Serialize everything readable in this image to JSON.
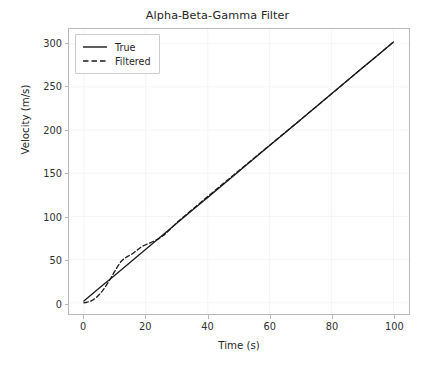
{
  "figure": {
    "width": 435,
    "height": 365,
    "background_color": "#ffffff"
  },
  "chart_data": {
    "type": "line",
    "title": "Alpha-Beta-Gamma Filter",
    "xlabel": "Time (s)",
    "ylabel": "Velocity (m/s)",
    "xlim": [
      -4.8,
      105.0
    ],
    "ylim": [
      -13.0,
      317.0
    ],
    "xticks": [
      0,
      20,
      40,
      60,
      80,
      100
    ],
    "yticks": [
      0,
      50,
      100,
      150,
      200,
      250,
      300
    ],
    "xtick_labels": [
      "0",
      "20",
      "40",
      "60",
      "80",
      "100"
    ],
    "ytick_labels": [
      "0",
      "50",
      "100",
      "150",
      "200",
      "250",
      "300"
    ],
    "grid": true,
    "grid_color": "#f4f4f4",
    "axes_edge_color": "#b8b8b8",
    "legend": {
      "position": "upper left",
      "entries": [
        {
          "label": "True",
          "linestyle": "solid",
          "color": "#1a1a1a"
        },
        {
          "label": "Filtered",
          "linestyle": "dashed",
          "color": "#1a1a1a"
        }
      ]
    },
    "series": [
      {
        "name": "True",
        "linestyle": "solid",
        "color": "#1a1a1a",
        "linewidth": 1.3,
        "x": [
          0,
          5,
          10,
          15,
          20,
          25,
          30,
          35,
          40,
          45,
          50,
          55,
          60,
          65,
          70,
          75,
          80,
          85,
          90,
          95,
          100
        ],
        "y": [
          2,
          17,
          32,
          47,
          62,
          77,
          92,
          107,
          122,
          137,
          152,
          167,
          182,
          197,
          212,
          227,
          242,
          257,
          272,
          287,
          302
        ]
      },
      {
        "name": "Filtered",
        "linestyle": "dashed",
        "color": "#1a1a1a",
        "linewidth": 1.3,
        "x": [
          0,
          1,
          2,
          3,
          4,
          5,
          6,
          7,
          8,
          9,
          10,
          11,
          12,
          13,
          14,
          15,
          16,
          17,
          18,
          19,
          20,
          22,
          24,
          26,
          28,
          30,
          35,
          40,
          45,
          50,
          55,
          60,
          65,
          70,
          75,
          80,
          85,
          90,
          95,
          100
        ],
        "y": [
          0,
          0.6,
          1.6,
          3.4,
          6.0,
          9.5,
          13.8,
          18.8,
          24.4,
          30.3,
          36.6,
          42.6,
          47.8,
          51.2,
          53.4,
          55.2,
          57.6,
          60.4,
          63.2,
          65.6,
          67.2,
          70.4,
          73.6,
          78.8,
          85.6,
          92.8,
          108.0,
          123.0,
          138.0,
          152.8,
          167.6,
          182.4,
          197.2,
          212.0,
          227.0,
          242.0,
          257.0,
          272.0,
          287.0,
          302.0
        ]
      }
    ]
  }
}
